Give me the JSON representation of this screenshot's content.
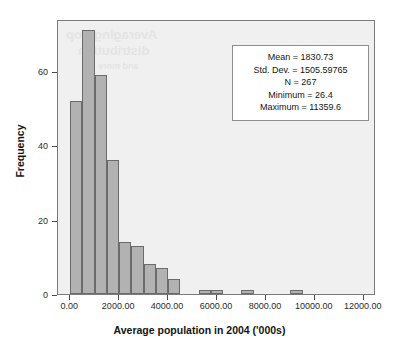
{
  "chart_data": {
    "type": "bar",
    "title": "",
    "xlabel": "Average population in 2004 ('000s)",
    "ylabel": "Frequency",
    "xlim": [
      -500,
      12500
    ],
    "ylim": [
      0,
      74
    ],
    "grid": false,
    "legend": null,
    "bin_width": 500,
    "xticks": [
      "0.00",
      "2000.00",
      "4000.00",
      "6000.00",
      "8000.00",
      "10000.00",
      "12000.00"
    ],
    "xtick_values": [
      0,
      2000,
      4000,
      6000,
      8000,
      10000,
      12000
    ],
    "yticks": [
      "0",
      "20",
      "40",
      "60"
    ],
    "ytick_values": [
      0,
      20,
      40,
      60
    ],
    "bars": [
      {
        "bin_start": 0,
        "bin_end": 500,
        "value": 52
      },
      {
        "bin_start": 500,
        "bin_end": 1000,
        "value": 71
      },
      {
        "bin_start": 1000,
        "bin_end": 1500,
        "value": 59
      },
      {
        "bin_start": 1500,
        "bin_end": 2000,
        "value": 36
      },
      {
        "bin_start": 2000,
        "bin_end": 2500,
        "value": 14
      },
      {
        "bin_start": 2500,
        "bin_end": 3000,
        "value": 13
      },
      {
        "bin_start": 3000,
        "bin_end": 3500,
        "value": 8
      },
      {
        "bin_start": 3500,
        "bin_end": 4000,
        "value": 7
      },
      {
        "bin_start": 4000,
        "bin_end": 4500,
        "value": 4
      },
      {
        "bin_start": 5250,
        "bin_end": 5750,
        "value": 1
      },
      {
        "bin_start": 5750,
        "bin_end": 6250,
        "value": 1
      },
      {
        "bin_start": 7000,
        "bin_end": 7500,
        "value": 1
      },
      {
        "bin_start": 9000,
        "bin_end": 9500,
        "value": 1
      }
    ],
    "bar_color": "#b2b2b2",
    "bar_edge_color": "#6b6b6b",
    "plot_background": "#f0f0f0"
  },
  "stats": {
    "mean": "Mean = 1830.73",
    "std_dev": "Std. Dev. = 1505.59765",
    "n": "N = 267",
    "minimum": "Minimum = 26.4",
    "maximum": "Maximum = 11359.6"
  },
  "watermark": {
    "line1": "Averaging Pop",
    "line2": "distribution",
    "line3": "and more"
  }
}
